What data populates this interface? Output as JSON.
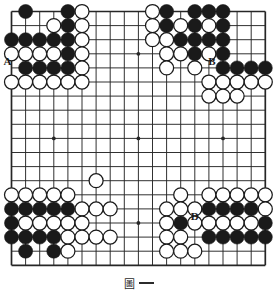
{
  "figure": {
    "caption_glyph": "圖",
    "caption_number": "一",
    "caption_full": "圖一"
  },
  "board": {
    "size": 19,
    "line_color": "#262626",
    "background_color": "#ffffff",
    "black_stone_color": "#1a1a1a",
    "white_stone_color": "#ffffff",
    "white_stone_border_color": "#1a1a1a",
    "label_color": "#1a1a1a",
    "star_points": [
      {
        "col": 4,
        "row": 4
      },
      {
        "col": 10,
        "row": 4
      },
      {
        "col": 16,
        "row": 4
      },
      {
        "col": 4,
        "row": 10
      },
      {
        "col": 10,
        "row": 10
      },
      {
        "col": 16,
        "row": 10
      },
      {
        "col": 4,
        "row": 16
      },
      {
        "col": 10,
        "row": 16
      },
      {
        "col": 16,
        "row": 16
      }
    ],
    "black_stones": [
      {
        "col": 2,
        "row": 1
      },
      {
        "col": 5,
        "row": 1
      },
      {
        "col": 5,
        "row": 2
      },
      {
        "col": 1,
        "row": 3
      },
      {
        "col": 2,
        "row": 3
      },
      {
        "col": 3,
        "row": 3
      },
      {
        "col": 4,
        "row": 3
      },
      {
        "col": 5,
        "row": 3
      },
      {
        "col": 5,
        "row": 4
      },
      {
        "col": 2,
        "row": 5
      },
      {
        "col": 3,
        "row": 5
      },
      {
        "col": 4,
        "row": 5
      },
      {
        "col": 5,
        "row": 5
      },
      {
        "col": 12,
        "row": 1
      },
      {
        "col": 14,
        "row": 1
      },
      {
        "col": 15,
        "row": 1
      },
      {
        "col": 16,
        "row": 1
      },
      {
        "col": 12,
        "row": 2
      },
      {
        "col": 14,
        "row": 2
      },
      {
        "col": 16,
        "row": 2
      },
      {
        "col": 13,
        "row": 3
      },
      {
        "col": 14,
        "row": 3
      },
      {
        "col": 15,
        "row": 3
      },
      {
        "col": 16,
        "row": 3
      },
      {
        "col": 14,
        "row": 4
      },
      {
        "col": 16,
        "row": 4
      },
      {
        "col": 16,
        "row": 5
      },
      {
        "col": 17,
        "row": 5
      },
      {
        "col": 18,
        "row": 5
      },
      {
        "col": 19,
        "row": 5
      },
      {
        "col": 1,
        "row": 15
      },
      {
        "col": 2,
        "row": 15
      },
      {
        "col": 3,
        "row": 15
      },
      {
        "col": 4,
        "row": 15
      },
      {
        "col": 5,
        "row": 15
      },
      {
        "col": 1,
        "row": 16
      },
      {
        "col": 1,
        "row": 17
      },
      {
        "col": 2,
        "row": 17
      },
      {
        "col": 3,
        "row": 17
      },
      {
        "col": 4,
        "row": 17
      },
      {
        "col": 2,
        "row": 18
      },
      {
        "col": 4,
        "row": 18
      },
      {
        "col": 13,
        "row": 16
      },
      {
        "col": 15,
        "row": 15
      },
      {
        "col": 16,
        "row": 15
      },
      {
        "col": 17,
        "row": 15
      },
      {
        "col": 18,
        "row": 15
      },
      {
        "col": 19,
        "row": 16
      },
      {
        "col": 15,
        "row": 17
      },
      {
        "col": 16,
        "row": 17
      },
      {
        "col": 17,
        "row": 17
      },
      {
        "col": 18,
        "row": 17
      },
      {
        "col": 19,
        "row": 17
      }
    ],
    "white_stones": [
      {
        "col": 6,
        "row": 1
      },
      {
        "col": 4,
        "row": 2
      },
      {
        "col": 6,
        "row": 2
      },
      {
        "col": 6,
        "row": 3
      },
      {
        "col": 1,
        "row": 4
      },
      {
        "col": 2,
        "row": 4
      },
      {
        "col": 3,
        "row": 4
      },
      {
        "col": 4,
        "row": 4
      },
      {
        "col": 6,
        "row": 4
      },
      {
        "col": 6,
        "row": 5
      },
      {
        "col": 1,
        "row": 6
      },
      {
        "col": 2,
        "row": 6
      },
      {
        "col": 3,
        "row": 6
      },
      {
        "col": 4,
        "row": 6
      },
      {
        "col": 5,
        "row": 6
      },
      {
        "col": 6,
        "row": 6
      },
      {
        "col": 11,
        "row": 1
      },
      {
        "col": 11,
        "row": 2
      },
      {
        "col": 13,
        "row": 2
      },
      {
        "col": 15,
        "row": 2
      },
      {
        "col": 11,
        "row": 3
      },
      {
        "col": 12,
        "row": 3
      },
      {
        "col": 12,
        "row": 4
      },
      {
        "col": 13,
        "row": 4
      },
      {
        "col": 15,
        "row": 4
      },
      {
        "col": 12,
        "row": 5
      },
      {
        "col": 14,
        "row": 5
      },
      {
        "col": 15,
        "row": 6
      },
      {
        "col": 16,
        "row": 6
      },
      {
        "col": 17,
        "row": 6
      },
      {
        "col": 18,
        "row": 6
      },
      {
        "col": 19,
        "row": 6
      },
      {
        "col": 15,
        "row": 7
      },
      {
        "col": 16,
        "row": 7
      },
      {
        "col": 17,
        "row": 7
      },
      {
        "col": 7,
        "row": 13
      },
      {
        "col": 1,
        "row": 14
      },
      {
        "col": 2,
        "row": 14
      },
      {
        "col": 3,
        "row": 14
      },
      {
        "col": 4,
        "row": 14
      },
      {
        "col": 5,
        "row": 14
      },
      {
        "col": 6,
        "row": 15
      },
      {
        "col": 7,
        "row": 15
      },
      {
        "col": 8,
        "row": 15
      },
      {
        "col": 2,
        "row": 16
      },
      {
        "col": 3,
        "row": 16
      },
      {
        "col": 4,
        "row": 16
      },
      {
        "col": 5,
        "row": 16
      },
      {
        "col": 6,
        "row": 16
      },
      {
        "col": 5,
        "row": 17
      },
      {
        "col": 6,
        "row": 17
      },
      {
        "col": 7,
        "row": 17
      },
      {
        "col": 8,
        "row": 17
      },
      {
        "col": 5,
        "row": 18
      },
      {
        "col": 13,
        "row": 14
      },
      {
        "col": 15,
        "row": 14
      },
      {
        "col": 16,
        "row": 14
      },
      {
        "col": 17,
        "row": 14
      },
      {
        "col": 18,
        "row": 14
      },
      {
        "col": 19,
        "row": 14
      },
      {
        "col": 12,
        "row": 15
      },
      {
        "col": 13,
        "row": 15
      },
      {
        "col": 14,
        "row": 15
      },
      {
        "col": 19,
        "row": 15
      },
      {
        "col": 12,
        "row": 16
      },
      {
        "col": 14,
        "row": 16
      },
      {
        "col": 15,
        "row": 16
      },
      {
        "col": 16,
        "row": 16
      },
      {
        "col": 17,
        "row": 16
      },
      {
        "col": 18,
        "row": 16
      },
      {
        "col": 12,
        "row": 17
      },
      {
        "col": 13,
        "row": 17
      },
      {
        "col": 12,
        "row": 18
      },
      {
        "col": 13,
        "row": 18
      },
      {
        "col": 14,
        "row": 18
      }
    ],
    "point_labels": [
      {
        "text": "A",
        "col": 1,
        "row": 5,
        "dx": -4,
        "dy": -3
      },
      {
        "text": "B",
        "col": 15,
        "row": 5,
        "dx": 3,
        "dy": -3
      },
      {
        "text": "D",
        "col": 14,
        "row": 16,
        "dx": 0,
        "dy": -3
      }
    ]
  }
}
